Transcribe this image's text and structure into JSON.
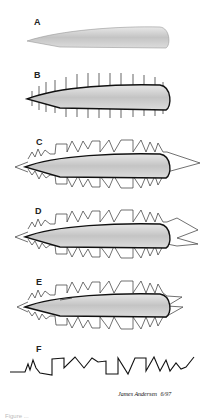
{
  "figure": {
    "panels": [
      {
        "label": "A",
        "description": "plain airfoil shape"
      },
      {
        "label": "B",
        "description": "airfoil outlined with perpendicular tick marks"
      },
      {
        "label": "C",
        "description": "airfoil with zigzag/square-wave pattern and triangular tail"
      },
      {
        "label": "D",
        "description": "airfoil with zigzag/square-wave pattern and split tail"
      },
      {
        "label": "E",
        "description": "airfoil with zigzag pattern, shaded wing"
      },
      {
        "label": "F",
        "description": "unrolled zigzag line pattern"
      }
    ],
    "signature": {
      "name": "James Andersen",
      "date": "6/97"
    },
    "caption_partial": "Figure ..."
  },
  "colors": {
    "ink": "#1a1a1a",
    "shade": "#cfcfcf",
    "background": "#ffffff"
  }
}
